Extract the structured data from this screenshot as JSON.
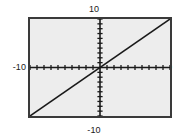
{
  "figure": {
    "name": "coordinate-graph",
    "background_color": "#ffffff",
    "plot_background_color": "#ededed",
    "frame_color": "#3a3a3a",
    "axis_color": "#1a1a1a",
    "curve_color": "#1a1a1a"
  },
  "labels": {
    "y_max": "10",
    "y_min": "-10",
    "x_min": "-10",
    "x_max": "10"
  },
  "chart_data": {
    "type": "line",
    "title": "",
    "xlabel": "",
    "ylabel": "",
    "xlim": [
      -10,
      10
    ],
    "ylim": [
      -10,
      10
    ],
    "grid": false,
    "legend": false,
    "axes": {
      "x_axis_at_y": 0,
      "y_axis_at_x": 0,
      "x_tick_interval": 1,
      "y_tick_interval": 1,
      "x_ticks": [
        -10,
        -9,
        -8,
        -7,
        -6,
        -5,
        -4,
        -3,
        -2,
        -1,
        1,
        2,
        3,
        4,
        5,
        6,
        7,
        8,
        9,
        10
      ],
      "y_ticks": [
        -10,
        -9,
        -8,
        -7,
        -6,
        -5,
        -4,
        -3,
        -2,
        -1,
        1,
        2,
        3,
        4,
        5,
        6,
        7,
        8,
        9,
        10
      ],
      "tick_labels_shown": [
        "-10",
        "10"
      ]
    },
    "series": [
      {
        "name": "y = x",
        "equation": "y = x",
        "slope": 1,
        "intercept": 0,
        "x": [
          -10,
          10
        ],
        "values": [
          -10,
          10
        ]
      }
    ]
  }
}
